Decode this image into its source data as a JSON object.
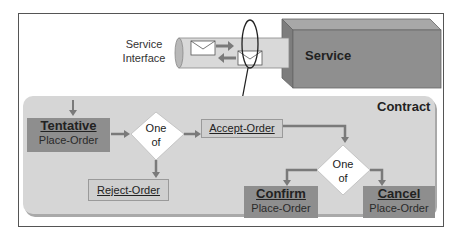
{
  "service_interface": {
    "label_line1": "Service",
    "label_line2": "Interface"
  },
  "service": {
    "label": "Service"
  },
  "contract": {
    "title": "Contract",
    "states": {
      "tentative": {
        "title": "Tentative",
        "subtitle": "Place-Order"
      },
      "confirm": {
        "title": "Confirm",
        "subtitle": "Place-Order"
      },
      "cancel": {
        "title": "Cancel",
        "subtitle": "Place-Order"
      }
    },
    "actions": {
      "accept": "Accept-Order",
      "reject": "Reject-Order"
    },
    "choices": [
      {
        "line1": "One",
        "line2": "of"
      },
      {
        "line1": "One",
        "line2": "of"
      }
    ]
  },
  "colors": {
    "state_fill": "#8e8e8e",
    "action_fill": "#cfcfcf",
    "contract_fill": "#d6d6d6",
    "service_fill": "#8f8f8f",
    "arrow": "#7a7a7a"
  }
}
